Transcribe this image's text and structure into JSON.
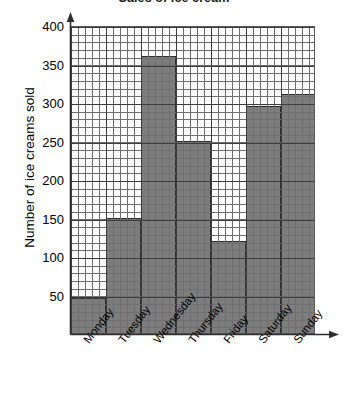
{
  "chart_data": {
    "type": "bar",
    "title": "Sales of ice cream",
    "xlabel": "",
    "ylabel": "Number of ice creams sold",
    "categories": [
      "Monday",
      "Tuesday",
      "Wednesday",
      "Thursday",
      "Friday",
      "Saturday",
      "Sunday"
    ],
    "values": [
      45,
      150,
      360,
      250,
      120,
      295,
      310
    ],
    "ylim": [
      0,
      400
    ],
    "yticks": [
      50,
      100,
      150,
      200,
      250,
      300,
      350,
      400
    ],
    "ytick_labels": [
      "50",
      "100",
      "150",
      "200",
      "250",
      "300",
      "350",
      "400"
    ],
    "y_major_step": 50,
    "y_minor_step": 10,
    "grid": true,
    "legend": null,
    "bar_color": "#7d7d7d",
    "grid_color": "#3d3d3d",
    "minor_grid_color": "#6f6f6f",
    "axis_color": "#2e2e2e"
  }
}
